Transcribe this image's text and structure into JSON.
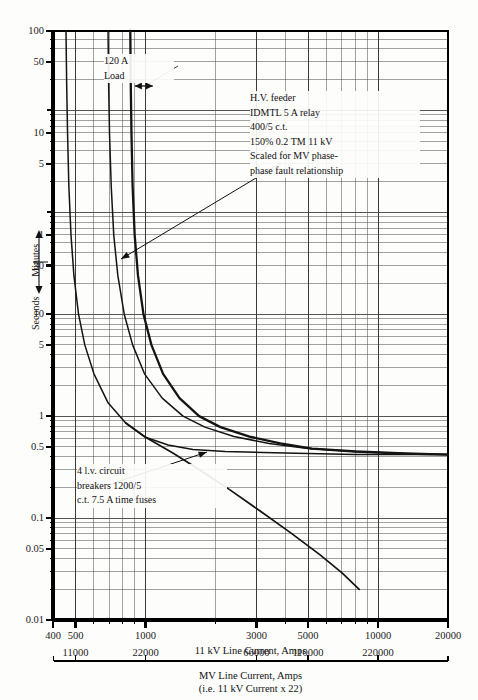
{
  "chart_data": {
    "type": "line",
    "title": "",
    "xlabel": "11 kV Line Current, Amps",
    "ylabel": "Seconds — Minutes",
    "xscale": "log",
    "yscale": "log",
    "xlim": [
      400,
      20000
    ],
    "ylim_seconds": [
      0.01,
      6000
    ],
    "grid": true,
    "legend": "none",
    "x_ticks": [
      "400",
      "500",
      "1000",
      "3000",
      "5000",
      "10000",
      "20000"
    ],
    "x_tick_values": [
      400,
      500,
      1000,
      3000,
      5000,
      10000,
      20000
    ],
    "y_ticks_minutes": [
      "100",
      "50",
      "10",
      "5",
      "1"
    ],
    "y_tick_minutes_values": [
      100,
      50,
      10,
      5,
      1
    ],
    "y_ticks_seconds": [
      "30",
      "10",
      "5",
      "1",
      "0.5",
      "0.1",
      "0.05",
      "0.01"
    ],
    "y_tick_seconds_values": [
      30,
      10,
      5,
      1,
      0.5,
      0.1,
      0.05,
      0.01
    ],
    "secondary_x_axis": {
      "label_line1": "MV Line Current, Amps",
      "label_line2": "(i.e. 11 kV Current x 22)",
      "ticks": [
        "11000",
        "22000",
        "66000",
        "110000",
        "220000"
      ],
      "tick_values": [
        11000,
        22000,
        66000,
        110000,
        220000
      ],
      "multiplier": 22
    },
    "series": [
      {
        "name": "l.v. circuit breaker / fuse curve (leftmost)",
        "points": [
          [
            455,
            6000
          ],
          [
            458,
            1800
          ],
          [
            462,
            600
          ],
          [
            468,
            180
          ],
          [
            478,
            60
          ],
          [
            492,
            24
          ],
          [
            515,
            10
          ],
          [
            548,
            5
          ],
          [
            600,
            2.6
          ],
          [
            690,
            1.35
          ],
          [
            820,
            0.86
          ],
          [
            1000,
            0.62
          ],
          [
            1250,
            0.52
          ],
          [
            1600,
            0.47
          ],
          [
            2200,
            0.45
          ],
          [
            3200,
            0.44
          ],
          [
            5000,
            0.43
          ],
          [
            8000,
            0.42
          ],
          [
            13000,
            0.42
          ],
          [
            20000,
            0.42
          ]
        ]
      },
      {
        "name": "intermediate relay curve",
        "points": [
          [
            690,
            6000
          ],
          [
            694,
            1800
          ],
          [
            700,
            600
          ],
          [
            712,
            180
          ],
          [
            730,
            60
          ],
          [
            760,
            24
          ],
          [
            810,
            10
          ],
          [
            880,
            5
          ],
          [
            990,
            2.6
          ],
          [
            1180,
            1.5
          ],
          [
            1450,
            1.0
          ],
          [
            1800,
            0.78
          ],
          [
            2400,
            0.63
          ],
          [
            3400,
            0.54
          ],
          [
            5000,
            0.48
          ],
          [
            8000,
            0.45
          ],
          [
            13000,
            0.43
          ],
          [
            20000,
            0.42
          ]
        ]
      },
      {
        "name": "H.V. feeder IDMTL relay curve",
        "points": [
          [
            860,
            6000
          ],
          [
            864,
            1800
          ],
          [
            870,
            600
          ],
          [
            880,
            180
          ],
          [
            898,
            60
          ],
          [
            928,
            24
          ],
          [
            980,
            10
          ],
          [
            1060,
            5
          ],
          [
            1190,
            2.6
          ],
          [
            1400,
            1.5
          ],
          [
            1700,
            1.0
          ],
          [
            2100,
            0.78
          ],
          [
            2800,
            0.63
          ],
          [
            3800,
            0.54
          ],
          [
            5200,
            0.48
          ],
          [
            8000,
            0.45
          ],
          [
            13000,
            0.43
          ],
          [
            20000,
            0.42
          ]
        ]
      },
      {
        "name": "7.5 A time fuse curve",
        "points": [
          [
            820,
            0.86
          ],
          [
            1000,
            0.62
          ],
          [
            1300,
            0.44
          ],
          [
            1700,
            0.3
          ],
          [
            2300,
            0.19
          ],
          [
            3100,
            0.118
          ],
          [
            4200,
            0.072
          ],
          [
            5600,
            0.044
          ],
          [
            7000,
            0.029
          ],
          [
            8300,
            0.02
          ]
        ]
      }
    ],
    "annotations": [
      {
        "id": "load-band",
        "text_lines": [
          "120 A",
          "Load"
        ],
        "note": "double-headed arrow spanning the 120 A load band"
      },
      {
        "id": "hv-feeder",
        "text_lines": [
          "H.V. feeder",
          "IDMTL 5 A relay",
          "400/5 c.t.",
          "150% 0.2 TM 11 kV",
          "Scaled for MV phase-",
          "phase fault relationship"
        ]
      },
      {
        "id": "lv-breakers",
        "text_lines": [
          "4 l.v. circuit",
          "breakers 1200/5",
          "c.t. 7.5 A time fuses"
        ]
      }
    ]
  },
  "axis": {
    "y_label_seconds": "Seconds",
    "y_label_minutes": "Minutes"
  },
  "colors": {
    "curve": "#141414",
    "grid": "#555555",
    "axis": "#000000",
    "background": "#fdfdfc"
  }
}
